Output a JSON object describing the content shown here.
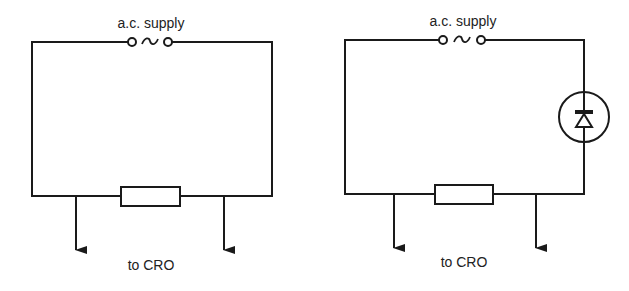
{
  "figures": [
    {
      "id": "circuit-resistor",
      "supply_label": "a.c. supply",
      "supply_symbol": "~",
      "output_label": "to CRO",
      "components": [
        "ac-supply",
        "resistor"
      ]
    },
    {
      "id": "circuit-diode",
      "supply_label": "a.c. supply",
      "supply_symbol": "~",
      "output_label": "to CRO",
      "components": [
        "ac-supply",
        "diode",
        "resistor"
      ]
    }
  ],
  "colors": {
    "line": "#1a1a1a",
    "background": "#ffffff"
  }
}
